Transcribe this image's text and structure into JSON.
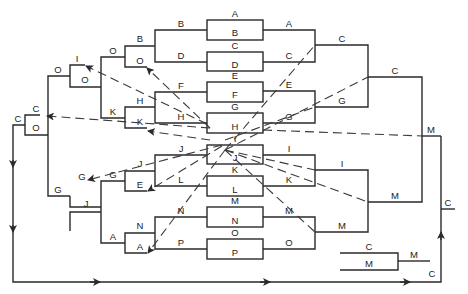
{
  "diagram": {
    "colors": {
      "line": "#2a2a2a",
      "background": "#ffffff"
    },
    "boxes": [
      {
        "top": "A",
        "bottom": "B",
        "x": 207,
        "y": 20,
        "w": 56,
        "h": 20
      },
      {
        "top": "C",
        "bottom": "D",
        "x": 207,
        "y": 52,
        "w": 56,
        "h": 20
      },
      {
        "top": "E",
        "bottom": "F",
        "x": 207,
        "y": 82,
        "w": 56,
        "h": 20
      },
      {
        "top": "G",
        "bottom": "H",
        "x": 207,
        "y": 113,
        "w": 56,
        "h": 20
      },
      {
        "top": "I",
        "bottom": "J",
        "x": 207,
        "y": 145,
        "w": 56,
        "h": 20
      },
      {
        "top": "K",
        "bottom": "L",
        "x": 207,
        "y": 176,
        "w": 56,
        "h": 20
      },
      {
        "top": "M",
        "bottom": "N",
        "x": 207,
        "y": 207,
        "w": 56,
        "h": 20
      },
      {
        "top": "O",
        "bottom": "P",
        "x": 207,
        "y": 239,
        "w": 56,
        "h": 20
      }
    ],
    "left_labels": {
      "r1": [
        "B",
        "D",
        "F",
        "H",
        "J",
        "L",
        "N",
        "P"
      ],
      "r2_box1": [
        "B",
        "O"
      ],
      "r2_box2": [
        "H",
        "K"
      ],
      "r2_box3": [
        "J",
        "E"
      ],
      "r2_box4": [
        "N",
        "A"
      ],
      "r3_box1": [
        "I",
        "O"
      ],
      "r3_k": "K",
      "r3_box2": [
        "G",
        "J"
      ],
      "r3_a": "A",
      "r3_o": "O",
      "r4_box": [
        "C",
        "O"
      ],
      "r4_g": "G",
      "r5": "C"
    },
    "right_labels": {
      "r1": [
        "A",
        "C",
        "E",
        "G",
        "I",
        "K",
        "M",
        "O"
      ],
      "r2": [
        "C",
        "G",
        "I",
        "M"
      ],
      "r3": [
        "C",
        "M"
      ],
      "final": "M",
      "champion": "C",
      "bottom_c": "C"
    },
    "legend": {
      "top": "C",
      "bottom": "M",
      "result": "M"
    }
  }
}
